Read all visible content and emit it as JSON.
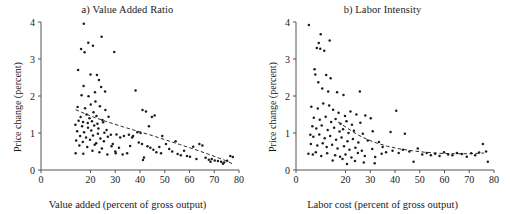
{
  "figure": {
    "type": "multi-panel-scatter",
    "width": 510,
    "height": 214,
    "background": "#ffffff",
    "marker_color": "#1c1c1c",
    "axis_color": "#555555",
    "trendline_color": "#2a2a2a",
    "trendline_style": "dashed"
  },
  "chart_data": [
    {
      "type": "scatter",
      "panel": "a",
      "title": "a) Value Added Ratio",
      "xlabel": "Value added (percent of gross output)",
      "ylabel": "Price change (percent)",
      "xlim": [
        0,
        80
      ],
      "ylim": [
        0,
        4
      ],
      "xticks": [
        0,
        20,
        30,
        40,
        50,
        60,
        70,
        80
      ],
      "xtick_labels": [
        "0",
        "20",
        "30",
        "40",
        "50",
        "60",
        "70",
        "80"
      ],
      "yticks": [
        0,
        1,
        2,
        3,
        4
      ],
      "ytick_labels": [
        "0",
        "1",
        "2",
        "3",
        "4"
      ],
      "grid": false,
      "legend": "none",
      "trendline": {
        "label": "fitted dashed trend",
        "x": [
          14,
          20,
          26,
          32,
          38,
          44,
          50,
          56,
          62,
          68,
          74,
          78
        ],
        "y": [
          1.63,
          1.46,
          1.32,
          1.19,
          1.07,
          0.95,
          0.82,
          0.69,
          0.56,
          0.42,
          0.27,
          0.15
        ]
      },
      "points": [
        [
          17.3,
          3.95
        ],
        [
          16.2,
          3.27
        ],
        [
          19.1,
          3.44
        ],
        [
          21.0,
          3.36
        ],
        [
          24.5,
          3.6
        ],
        [
          17.6,
          3.18
        ],
        [
          29.6,
          3.19
        ],
        [
          15.0,
          2.7
        ],
        [
          20.0,
          2.58
        ],
        [
          22.6,
          2.57
        ],
        [
          17.2,
          2.27
        ],
        [
          23.4,
          2.43
        ],
        [
          21.8,
          2.1
        ],
        [
          24.3,
          2.24
        ],
        [
          25.9,
          2.12
        ],
        [
          16.4,
          2.02
        ],
        [
          19.2,
          1.99
        ],
        [
          38.2,
          2.15
        ],
        [
          14.8,
          1.7
        ],
        [
          17.8,
          1.67
        ],
        [
          20.1,
          1.77
        ],
        [
          22.0,
          1.85
        ],
        [
          23.8,
          1.72
        ],
        [
          26.0,
          1.62
        ],
        [
          21.2,
          1.56
        ],
        [
          18.4,
          1.5
        ],
        [
          16.0,
          1.43
        ],
        [
          19.6,
          1.4
        ],
        [
          22.4,
          1.46
        ],
        [
          24.8,
          1.35
        ],
        [
          27.3,
          1.44
        ],
        [
          15.2,
          1.33
        ],
        [
          17.0,
          1.3
        ],
        [
          18.9,
          1.27
        ],
        [
          20.6,
          1.32
        ],
        [
          22.8,
          1.25
        ],
        [
          25.1,
          1.29
        ],
        [
          13.9,
          1.22
        ],
        [
          16.6,
          1.18
        ],
        [
          19.0,
          1.14
        ],
        [
          21.5,
          1.2
        ],
        [
          23.2,
          1.12
        ],
        [
          26.5,
          1.08
        ],
        [
          14.6,
          1.05
        ],
        [
          17.4,
          1.02
        ],
        [
          20.3,
          1.07
        ],
        [
          23.0,
          0.98
        ],
        [
          25.6,
          1.01
        ],
        [
          28.2,
          0.95
        ],
        [
          15.8,
          0.92
        ],
        [
          18.2,
          0.88
        ],
        [
          21.0,
          0.93
        ],
        [
          24.0,
          0.85
        ],
        [
          27.0,
          0.9
        ],
        [
          30.5,
          0.96
        ],
        [
          14.2,
          0.8
        ],
        [
          16.9,
          0.76
        ],
        [
          19.8,
          0.82
        ],
        [
          22.3,
          0.72
        ],
        [
          25.4,
          0.78
        ],
        [
          29.0,
          0.7
        ],
        [
          32.0,
          0.88
        ],
        [
          15.5,
          0.66
        ],
        [
          18.7,
          0.62
        ],
        [
          21.7,
          0.68
        ],
        [
          24.6,
          0.58
        ],
        [
          28.5,
          0.64
        ],
        [
          31.5,
          0.6
        ],
        [
          34.8,
          0.45
        ],
        [
          14.0,
          0.45
        ],
        [
          17.1,
          0.44
        ],
        [
          20.8,
          0.52
        ],
        [
          23.6,
          0.48
        ],
        [
          26.8,
          0.42
        ],
        [
          30.0,
          0.5
        ],
        [
          33.5,
          0.92
        ],
        [
          35.5,
          0.95
        ],
        [
          36.8,
          0.88
        ],
        [
          38.9,
          1.02
        ],
        [
          40.2,
          1.0
        ],
        [
          41.0,
          1.62
        ],
        [
          42.4,
          1.58
        ],
        [
          43.6,
          1.18
        ],
        [
          44.8,
          1.43
        ],
        [
          45.9,
          1.47
        ],
        [
          39.5,
          0.74
        ],
        [
          40.8,
          0.7
        ],
        [
          41.6,
          0.34
        ],
        [
          41.2,
          0.27
        ],
        [
          43.0,
          0.64
        ],
        [
          44.2,
          0.6
        ],
        [
          45.4,
          0.55
        ],
        [
          46.6,
          0.48
        ],
        [
          47.8,
          0.62
        ],
        [
          49.0,
          0.92
        ],
        [
          50.5,
          0.7
        ],
        [
          51.8,
          0.57
        ],
        [
          53.0,
          0.5
        ],
        [
          54.4,
          0.78
        ],
        [
          55.2,
          0.43
        ],
        [
          56.5,
          0.4
        ],
        [
          57.8,
          0.52
        ],
        [
          59.0,
          0.38
        ],
        [
          60.2,
          0.36
        ],
        [
          61.5,
          0.63
        ],
        [
          62.8,
          0.3
        ],
        [
          64.0,
          0.7
        ],
        [
          65.2,
          0.66
        ],
        [
          66.5,
          0.33
        ],
        [
          67.8,
          0.28
        ],
        [
          69.0,
          0.3
        ],
        [
          70.2,
          0.26
        ],
        [
          71.5,
          0.24
        ],
        [
          72.8,
          0.22
        ],
        [
          74.0,
          0.2
        ],
        [
          75.2,
          0.25
        ],
        [
          76.5,
          0.38
        ],
        [
          77.5,
          0.35
        ],
        [
          73.5,
          0.17
        ],
        [
          68.5,
          0.22
        ],
        [
          30.2,
          0.45
        ],
        [
          33.0,
          0.42
        ],
        [
          36.0,
          0.65
        ],
        [
          37.2,
          0.92
        ],
        [
          48.5,
          0.45
        ]
      ]
    },
    {
      "type": "scatter",
      "panel": "b",
      "title": "b) Labor Intensity",
      "xlabel": "Labor cost (percent of gross output)",
      "ylabel": "Price change (percent)",
      "xlim": [
        0,
        80
      ],
      "ylim": [
        0,
        4
      ],
      "xticks": [
        0,
        20,
        30,
        40,
        50,
        60,
        70,
        80
      ],
      "xtick_labels": [
        "0",
        "20",
        "30",
        "40",
        "50",
        "60",
        "70",
        "80"
      ],
      "yticks": [
        0,
        1,
        2,
        3,
        4
      ],
      "ytick_labels": [
        "0",
        "1",
        "2",
        "3",
        "4"
      ],
      "grid": false,
      "legend": "none",
      "trendline": {
        "label": "fitted dashed trend",
        "x": [
          17,
          21,
          25,
          29,
          33,
          37,
          42,
          47,
          52,
          58,
          64,
          70,
          76
        ],
        "y": [
          1.3,
          1.12,
          0.95,
          0.82,
          0.72,
          0.64,
          0.57,
          0.52,
          0.48,
          0.45,
          0.44,
          0.44,
          0.46
        ]
      },
      "points": [
        [
          5.2,
          3.92
        ],
        [
          10.0,
          3.67
        ],
        [
          9.2,
          3.43
        ],
        [
          9.8,
          3.28
        ],
        [
          13.6,
          3.5
        ],
        [
          11.4,
          3.22
        ],
        [
          8.4,
          3.3
        ],
        [
          7.5,
          2.72
        ],
        [
          7.8,
          2.58
        ],
        [
          12.2,
          2.57
        ],
        [
          9.0,
          2.37
        ],
        [
          14.0,
          2.48
        ],
        [
          10.6,
          2.2
        ],
        [
          13.0,
          2.12
        ],
        [
          16.6,
          2.1
        ],
        [
          19.2,
          2.03
        ],
        [
          25.8,
          2.12
        ],
        [
          6.2,
          1.71
        ],
        [
          8.8,
          1.66
        ],
        [
          11.0,
          1.8
        ],
        [
          13.4,
          1.74
        ],
        [
          15.0,
          1.63
        ],
        [
          17.2,
          1.55
        ],
        [
          19.8,
          1.46
        ],
        [
          22.0,
          1.58
        ],
        [
          24.4,
          1.5
        ],
        [
          28.0,
          1.47
        ],
        [
          40.5,
          1.6
        ],
        [
          7.2,
          1.41
        ],
        [
          9.6,
          1.36
        ],
        [
          12.0,
          1.44
        ],
        [
          14.2,
          1.3
        ],
        [
          16.0,
          1.38
        ],
        [
          18.0,
          1.25
        ],
        [
          20.4,
          1.32
        ],
        [
          22.6,
          1.22
        ],
        [
          26.0,
          1.28
        ],
        [
          30.2,
          1.4
        ],
        [
          6.6,
          1.18
        ],
        [
          8.2,
          1.12
        ],
        [
          10.4,
          1.2
        ],
        [
          12.8,
          1.08
        ],
        [
          15.4,
          1.14
        ],
        [
          17.6,
          1.04
        ],
        [
          19.0,
          1.1
        ],
        [
          21.2,
          1.0
        ],
        [
          23.4,
          1.06
        ],
        [
          27.0,
          0.98
        ],
        [
          31.0,
          1.05
        ],
        [
          5.8,
          0.95
        ],
        [
          7.0,
          0.9
        ],
        [
          9.4,
          0.96
        ],
        [
          11.6,
          0.86
        ],
        [
          13.8,
          0.92
        ],
        [
          16.2,
          0.82
        ],
        [
          18.4,
          0.88
        ],
        [
          20.8,
          0.78
        ],
        [
          23.0,
          0.84
        ],
        [
          25.2,
          0.74
        ],
        [
          29.0,
          0.8
        ],
        [
          33.5,
          0.76
        ],
        [
          38.2,
          1.03
        ],
        [
          44.0,
          0.98
        ],
        [
          6.0,
          0.7
        ],
        [
          8.6,
          0.66
        ],
        [
          10.8,
          0.72
        ],
        [
          12.4,
          0.62
        ],
        [
          14.6,
          0.68
        ],
        [
          16.8,
          0.58
        ],
        [
          19.4,
          0.64
        ],
        [
          21.6,
          0.55
        ],
        [
          24.0,
          0.6
        ],
        [
          26.6,
          0.52
        ],
        [
          30.8,
          0.57
        ],
        [
          35.0,
          0.62
        ],
        [
          5.0,
          0.44
        ],
        [
          6.8,
          0.42
        ],
        [
          8.0,
          0.48
        ],
        [
          10.2,
          0.38
        ],
        [
          12.6,
          0.45
        ],
        [
          15.8,
          0.4
        ],
        [
          17.8,
          0.36
        ],
        [
          20.0,
          0.42
        ],
        [
          22.4,
          0.34
        ],
        [
          25.0,
          0.46
        ],
        [
          27.8,
          0.38
        ],
        [
          32.0,
          0.35
        ],
        [
          34.6,
          0.44
        ],
        [
          36.4,
          0.48
        ],
        [
          39.0,
          0.52
        ],
        [
          41.5,
          0.46
        ],
        [
          43.2,
          0.55
        ],
        [
          45.8,
          0.5
        ],
        [
          47.5,
          0.22
        ],
        [
          49.2,
          0.58
        ],
        [
          51.0,
          0.42
        ],
        [
          52.8,
          0.46
        ],
        [
          54.5,
          0.4
        ],
        [
          56.2,
          0.44
        ],
        [
          58.0,
          0.38
        ],
        [
          59.8,
          0.48
        ],
        [
          61.5,
          0.42
        ],
        [
          63.2,
          0.4
        ],
        [
          65.0,
          0.46
        ],
        [
          67.0,
          0.43
        ],
        [
          69.0,
          0.36
        ],
        [
          70.8,
          0.45
        ],
        [
          72.4,
          0.4
        ],
        [
          74.0,
          0.47
        ],
        [
          75.5,
          0.7
        ],
        [
          76.8,
          0.5
        ],
        [
          77.5,
          0.22
        ],
        [
          20.6,
          0.16
        ],
        [
          27.4,
          0.2
        ],
        [
          31.8,
          0.18
        ],
        [
          23.8,
          0.24
        ],
        [
          18.8,
          0.3
        ],
        [
          14.8,
          0.26
        ]
      ]
    }
  ]
}
